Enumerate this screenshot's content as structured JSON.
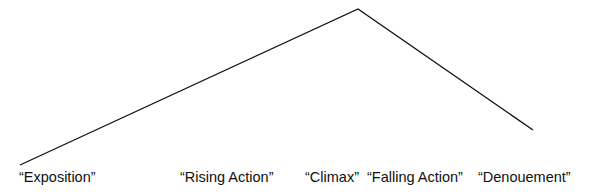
{
  "diagram": {
    "line_color": "#111111",
    "points": [
      {
        "x": 20,
        "y": 165
      },
      {
        "x": 358,
        "y": 9
      },
      {
        "x": 533,
        "y": 130
      }
    ],
    "labels": [
      {
        "text": "“Exposition”",
        "x": 19
      },
      {
        "text": "“Rising Action”",
        "x": 180
      },
      {
        "text": "“Climax”",
        "x": 305
      },
      {
        "text": "“Falling Action”",
        "x": 367
      },
      {
        "text": "“Denouement”",
        "x": 478
      }
    ]
  }
}
